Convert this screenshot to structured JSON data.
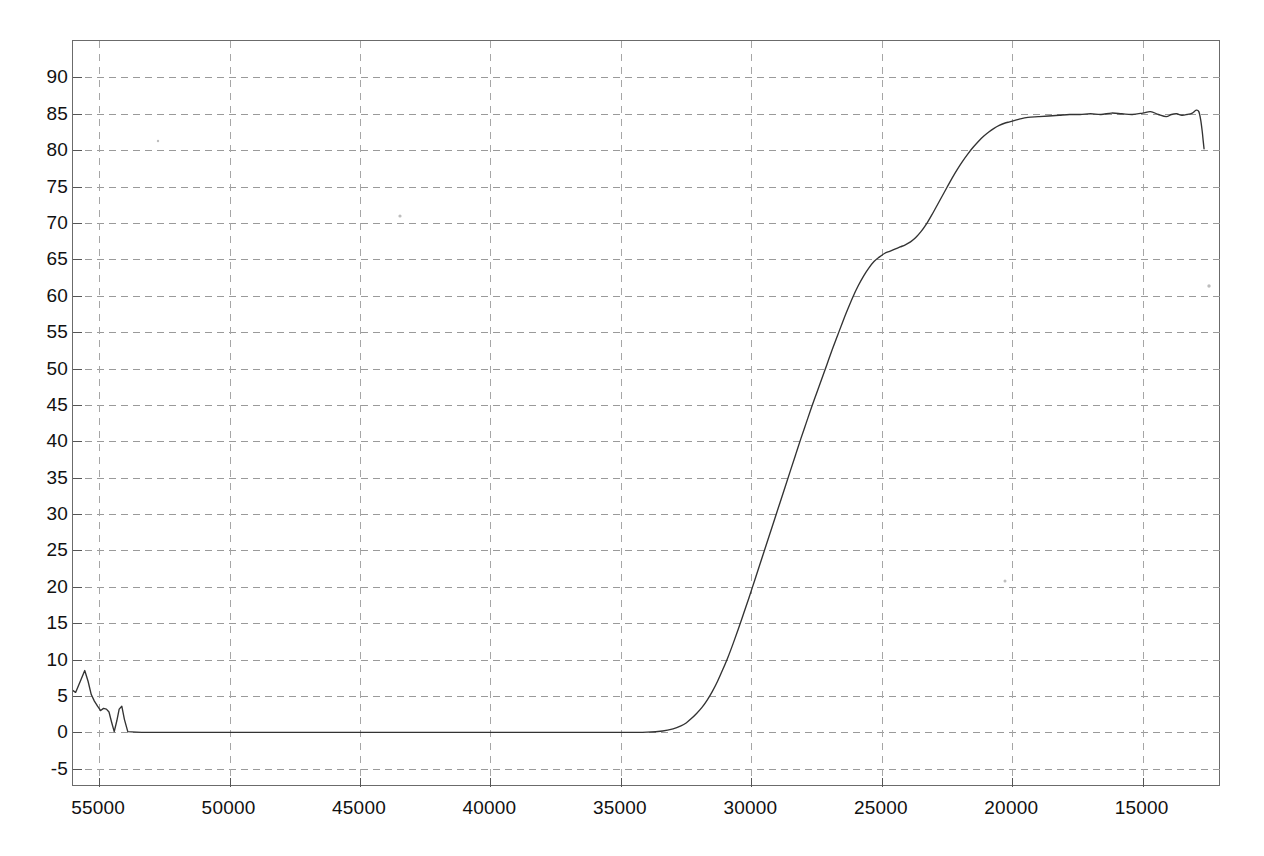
{
  "chart_data": {
    "type": "line",
    "title": "",
    "subtitle": "",
    "xlabel": "",
    "ylabel": "",
    "xlim": [
      56000,
      12000
    ],
    "ylim": [
      -7.5,
      95
    ],
    "x_axis_reversed": true,
    "grid": true,
    "legend": "none",
    "x_ticks": [
      55000,
      50000,
      45000,
      40000,
      35000,
      30000,
      25000,
      20000,
      15000
    ],
    "x_tick_labels": [
      "55000",
      "50000",
      "45000",
      "40000",
      "35000",
      "30000",
      "25000",
      "20000",
      "15000"
    ],
    "y_ticks": [
      -5,
      0,
      5,
      10,
      15,
      20,
      25,
      30,
      35,
      40,
      45,
      50,
      55,
      60,
      65,
      70,
      75,
      80,
      85,
      90
    ],
    "y_tick_labels": [
      "-5",
      "0",
      "5",
      "10",
      "15",
      "20",
      "25",
      "30",
      "35",
      "40",
      "45",
      "50",
      "55",
      "60",
      "65",
      "70",
      "75",
      "80",
      "85",
      "90"
    ],
    "line_color": "#333333",
    "grid_color": "#9a9a9a",
    "frame_color": "#6b6b6b",
    "background_color": "#ffffff",
    "series": [
      {
        "name": "transmittance",
        "x": [
          56100,
          55900,
          55700,
          55550,
          55420,
          55300,
          55180,
          55060,
          54940,
          54830,
          54720,
          54620,
          54520,
          54420,
          54320,
          54230,
          54130,
          54030,
          53900,
          53000,
          51000,
          49000,
          47000,
          45000,
          43000,
          41000,
          39000,
          37000,
          35000,
          34000,
          33400,
          33000,
          32700,
          32500,
          32300,
          32100,
          31900,
          31700,
          31500,
          31300,
          31100,
          30900,
          30700,
          30500,
          30300,
          30100,
          29900,
          29700,
          29500,
          29300,
          29100,
          28900,
          28700,
          28500,
          28300,
          28100,
          27900,
          27700,
          27500,
          27300,
          27100,
          26900,
          26700,
          26500,
          26300,
          26100,
          25900,
          25700,
          25500,
          25300,
          25100,
          24900,
          24700,
          24500,
          24300,
          24100,
          23900,
          23700,
          23500,
          23300,
          23100,
          22900,
          22700,
          22500,
          22300,
          22100,
          21900,
          21700,
          21500,
          21300,
          21100,
          20900,
          20700,
          20500,
          20300,
          20100,
          19900,
          19700,
          19400,
          19000,
          18600,
          18200,
          17800,
          17400,
          17000,
          16600,
          16200,
          15800,
          15400,
          15000,
          14700,
          14400,
          14100,
          13900,
          13700,
          13500,
          13300,
          13100,
          12950,
          12850,
          12780,
          12720,
          12680,
          12650
        ],
        "y": [
          6.0,
          5.5,
          7.2,
          8.5,
          7.0,
          5.2,
          4.3,
          3.6,
          3.0,
          3.3,
          3.2,
          2.8,
          1.4,
          0.1,
          1.6,
          3.2,
          3.6,
          1.8,
          0.1,
          0.0,
          0.0,
          0.0,
          0.0,
          0.0,
          0.0,
          0.0,
          0.0,
          0.0,
          0.0,
          0.05,
          0.2,
          0.5,
          0.9,
          1.3,
          1.9,
          2.6,
          3.4,
          4.4,
          5.6,
          7.0,
          8.6,
          10.3,
          12.2,
          14.2,
          16.3,
          18.4,
          20.6,
          22.8,
          25.0,
          27.2,
          29.4,
          31.6,
          33.8,
          36.0,
          38.2,
          40.4,
          42.5,
          44.6,
          46.6,
          48.6,
          50.6,
          52.6,
          54.5,
          56.4,
          58.2,
          59.9,
          61.4,
          62.7,
          63.8,
          64.7,
          65.3,
          65.8,
          66.1,
          66.4,
          66.7,
          67.0,
          67.4,
          68.0,
          68.8,
          69.8,
          71.0,
          72.3,
          73.6,
          74.9,
          76.2,
          77.4,
          78.5,
          79.5,
          80.4,
          81.2,
          81.9,
          82.5,
          83.0,
          83.4,
          83.7,
          83.9,
          84.1,
          84.3,
          84.5,
          84.6,
          84.7,
          84.8,
          84.9,
          84.9,
          85.0,
          84.9,
          85.1,
          85.0,
          84.9,
          85.1,
          85.3,
          84.9,
          84.6,
          84.9,
          85.0,
          84.8,
          84.9,
          85.1,
          85.5,
          85.3,
          84.2,
          82.6,
          81.2,
          80.2
        ]
      }
    ],
    "annotations": [
      {
        "kind": "noise-band",
        "x_range": [
          56100,
          53900
        ],
        "note": "low-level detector noise before signal onset"
      },
      {
        "kind": "baseline",
        "x_range": [
          53900,
          33000
        ],
        "value": 0,
        "note": "flat zero baseline"
      },
      {
        "kind": "rise",
        "x_range": [
          33000,
          21000
        ],
        "note": "sigmoidal rise from 0 to ~84"
      },
      {
        "kind": "shoulder",
        "x": 25300,
        "value": 65.5,
        "note": "inflection shoulder near 65"
      },
      {
        "kind": "plateau",
        "x_range": [
          20000,
          12800
        ],
        "value": 85,
        "note": "saturated plateau with small ripple"
      },
      {
        "kind": "edge-drop",
        "x_range": [
          12800,
          12650
        ],
        "note": "sharp drop at right edge"
      }
    ]
  },
  "specks": [
    {
      "x": 327,
      "y": 175,
      "r": 1.6
    },
    {
      "x": 932,
      "y": 540,
      "r": 1.5
    },
    {
      "x": 1136,
      "y": 245,
      "r": 1.7
    },
    {
      "x": 1163,
      "y": 660,
      "r": 1.4
    },
    {
      "x": 85,
      "y": 100,
      "r": 1.2
    },
    {
      "x": 1198,
      "y": 398,
      "r": 1.3
    }
  ]
}
